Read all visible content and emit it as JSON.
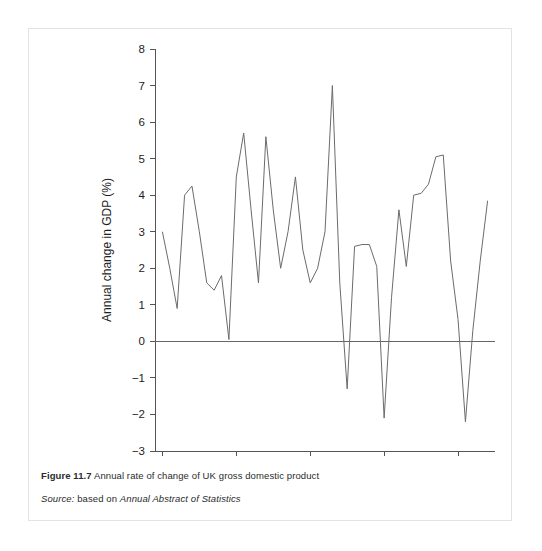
{
  "figure": {
    "caption_prefix": "Figure 11.7",
    "caption_text": " Annual rate of change of UK gross domestic product",
    "source_prefix": "Source:",
    "source_text": " based on ",
    "source_italic": "Annual Abstract of Statistics"
  },
  "colors": {
    "line": "#6b6b6b",
    "axis": "#555555",
    "zero_line": "#666666",
    "card_border": "#e3e3e3",
    "text": "#1d1d1d",
    "background": "#ffffff"
  },
  "chart_data": {
    "type": "line",
    "title": "Annual rate of change of UK gross domestic product",
    "xlabel": "",
    "ylabel": "Annual change in GDP (%)",
    "xlim": [
      1949,
      1995
    ],
    "ylim": [
      -3,
      8
    ],
    "y_ticks": [
      -3,
      -2,
      -1,
      0,
      1,
      2,
      3,
      4,
      5,
      6,
      7,
      8
    ],
    "y_tick_labels": [
      "−3",
      "−2",
      "−1",
      "0",
      "1",
      "2",
      "3",
      "4",
      "5",
      "6",
      "7",
      "8"
    ],
    "x_ticks": [
      1950,
      1960,
      1970,
      1980,
      1990
    ],
    "x_tick_labels": [
      "1950",
      "1960",
      "1970",
      "1980",
      "1990"
    ],
    "grid": false,
    "legend": false,
    "zero_reference_line": 0,
    "series": [
      {
        "name": "Annual change in UK GDP",
        "x": [
          1950,
          1951,
          1952,
          1953,
          1954,
          1955,
          1956,
          1957,
          1958,
          1959,
          1960,
          1961,
          1962,
          1963,
          1964,
          1965,
          1966,
          1967,
          1968,
          1969,
          1970,
          1971,
          1972,
          1973,
          1974,
          1975,
          1976,
          1977,
          1978,
          1979,
          1980,
          1981,
          1982,
          1983,
          1984,
          1985,
          1986,
          1987,
          1988,
          1989,
          1990,
          1991,
          1992,
          1993,
          1994
        ],
        "values": [
          3.0,
          2.0,
          0.9,
          4.0,
          4.25,
          3.0,
          1.6,
          1.4,
          1.8,
          0.05,
          4.5,
          5.7,
          3.6,
          1.6,
          5.6,
          3.6,
          2.0,
          3.0,
          4.5,
          2.5,
          1.6,
          2.0,
          3.0,
          7.0,
          1.6,
          -1.3,
          2.6,
          2.65,
          2.65,
          2.05,
          -2.1,
          1.2,
          3.6,
          2.05,
          4.0,
          4.05,
          4.3,
          5.05,
          5.1,
          2.2,
          0.6,
          -2.2,
          0.3,
          2.2,
          3.85
        ]
      }
    ]
  }
}
